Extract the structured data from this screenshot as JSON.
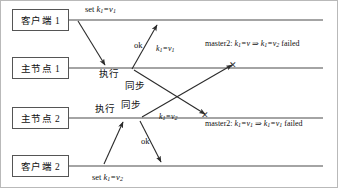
{
  "diagram": {
    "type": "sequence-diagram",
    "title": "",
    "width": 338,
    "height": 188,
    "line_color": "#4a4a4a",
    "border_color": "#b9b9b9",
    "participants": [
      {
        "id": "client1",
        "label": "客户端 1",
        "lifeline_y": 19
      },
      {
        "id": "master1",
        "label": "主节点 1",
        "lifeline_y": 67
      },
      {
        "id": "master2",
        "label": "主节点 2",
        "lifeline_y": 117
      },
      {
        "id": "client2",
        "label": "客户端 2",
        "lifeline_y": 165
      }
    ],
    "messages": {
      "set_k1_v1": {
        "text": "set ",
        "key": "k",
        "key_sub": "1",
        "eq": "=v",
        "val_sub": "1"
      },
      "set_k1_v2": {
        "text": "set ",
        "key": "k",
        "key_sub": "1",
        "eq": "=v",
        "val_sub": "2"
      },
      "ok_top": {
        "text": "ok"
      },
      "ok_bottom": {
        "text": "ok"
      },
      "exec_top": {
        "text": "执行"
      },
      "exec_bottom": {
        "text": "执行"
      },
      "sync_top": {
        "text": "同步"
      },
      "sync_bottom": {
        "text": "同步"
      },
      "sync_label_top": {
        "key": "k",
        "key_sub": "1",
        "eq": "=v",
        "val_sub": "1"
      },
      "sync_label_bottom": {
        "key": "k",
        "key_sub": "1",
        "eq": "=v",
        "val_sub": "2"
      }
    },
    "annotations": {
      "top_failure": {
        "prefix": "master2: ",
        "lhs_key": "k",
        "lhs_key_sub": "1",
        "lhs_eq": "=v",
        "lhs_val_sub": "",
        "arrow": "⇒",
        "rhs_key": "k",
        "rhs_key_sub": "1",
        "rhs_eq": "=v",
        "rhs_val_sub": "2",
        "suffix": " failed"
      },
      "bottom_failure": {
        "prefix": "master2: ",
        "lhs_key": "k",
        "lhs_key_sub": "1",
        "lhs_eq": "=v",
        "lhs_val_sub": "1",
        "arrow": "⇒",
        "rhs_key": "k",
        "rhs_key_sub": "1",
        "rhs_eq": "=v",
        "rhs_val_sub": "1",
        "suffix": " failed"
      }
    },
    "markers": {
      "x_mark_top": "✕",
      "x_mark_bottom": "✕"
    }
  }
}
